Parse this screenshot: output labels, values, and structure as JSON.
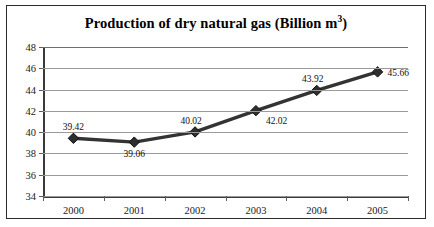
{
  "chart_data": {
    "type": "line",
    "title": "Production of dry natural gas (Billion m3)",
    "title_main": "Production of dry natural gas (Billion m",
    "title_sup": "3",
    "title_tail": ")",
    "xlabel": "",
    "ylabel": "",
    "categories": [
      "2000",
      "2001",
      "2002",
      "2003",
      "2004",
      "2005"
    ],
    "values": [
      39.42,
      39.06,
      40.02,
      42.02,
      43.92,
      45.66
    ],
    "point_labels": [
      "39.42",
      "39.06",
      "40.02",
      "42.02",
      "43.92",
      "45.66"
    ],
    "label_positions": [
      "above",
      "below",
      "above-left",
      "below-right",
      "above-left",
      "right"
    ],
    "ylim": [
      34,
      48
    ],
    "yticks": [
      48,
      46,
      44,
      42,
      40,
      38,
      36,
      34
    ],
    "ytick_labels": [
      "48",
      "46",
      "44",
      "42",
      "40",
      "38",
      "36",
      "34"
    ],
    "grid": true,
    "legend": "none",
    "series": [
      {
        "name": "Production of dry natural gas",
        "values": [
          39.42,
          39.06,
          40.02,
          42.02,
          43.92,
          45.66
        ],
        "marker": "diamond",
        "line_color": "#333333",
        "marker_color": "#2e2e2e"
      }
    ]
  },
  "style": {
    "border_color": "#2b2b2b",
    "grid_color": "#9a9a9a",
    "axis_color": "#3a3a3a",
    "text_color": "#111111",
    "background": "#ffffff"
  }
}
